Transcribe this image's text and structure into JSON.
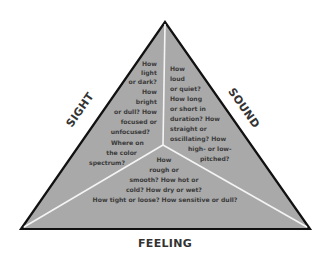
{
  "diagram": {
    "type": "triangle-of-senses",
    "colors": {
      "fill": "#a9a9a9",
      "outline": "#111111",
      "divider": "#f4f4f4",
      "text": "#3a3a3a",
      "label": "#333333",
      "background": "#ffffff"
    },
    "labels": {
      "sight": "SIGHT",
      "sound": "SOUND",
      "feeling": "FEELING"
    },
    "regions": {
      "sight": {
        "lines": [
          "How",
          "light",
          "or dark?",
          "How",
          "bright",
          "or dull? How",
          "focused or",
          "unfocused?",
          "Where on",
          "the color",
          "spectrum?"
        ]
      },
      "sound": {
        "lines": [
          "How",
          "loud",
          "or quiet?",
          "How long",
          "or short in",
          "duration? How",
          "straight or",
          "oscillating? How",
          "high- or low-",
          "pitched?"
        ]
      },
      "feeling": {
        "lines": [
          "How",
          "rough or",
          "smooth? How hot or",
          "cold? How dry or wet?",
          "How tight or loose? How sensitive or dull?"
        ]
      }
    }
  }
}
